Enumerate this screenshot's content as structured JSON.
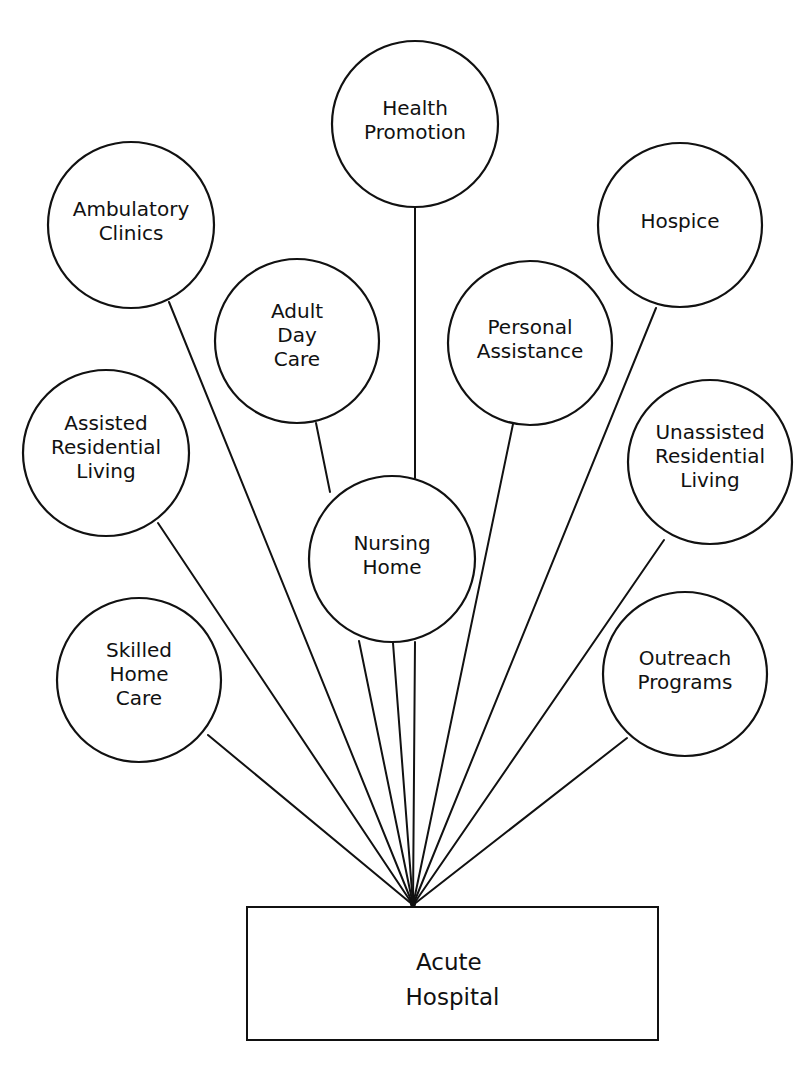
{
  "diagram": {
    "hub": {
      "label_lines": [
        "Acute",
        "Hospital"
      ],
      "x": 247,
      "y": 907,
      "w": 411,
      "h": 133,
      "anchor": [
        413,
        907
      ]
    },
    "nodes": [
      {
        "id": "health-promotion",
        "label_lines": [
          "Health",
          "Promotion"
        ],
        "cx": 415,
        "cy": 124,
        "r": 83,
        "edges": [
          [
            415,
            207,
            415,
            478
          ],
          [
            415,
            642,
            413,
            905
          ]
        ]
      },
      {
        "id": "ambulatory-clinics",
        "label_lines": [
          "Ambulatory",
          "Clinics"
        ],
        "cx": 131,
        "cy": 225,
        "r": 83,
        "edges": [
          [
            169,
            302,
            413,
            905
          ]
        ]
      },
      {
        "id": "hospice",
        "label_lines": [
          "Hospice"
        ],
        "cx": 680,
        "cy": 225,
        "r": 82,
        "edges": [
          [
            656,
            308,
            413,
            905
          ]
        ]
      },
      {
        "id": "adult-day-care",
        "label_lines": [
          "Adult",
          "Day",
          "Care"
        ],
        "cx": 297,
        "cy": 341,
        "r": 82,
        "edges": [
          [
            316,
            423,
            330,
            492
          ]
        ]
      },
      {
        "id": "personal-assistance",
        "label_lines": [
          "Personal",
          "Assistance"
        ],
        "cx": 530,
        "cy": 343,
        "r": 82,
        "edges": [
          [
            513,
            424,
            413,
            905
          ]
        ]
      },
      {
        "id": "assisted-residential-living",
        "label_lines": [
          "Assisted",
          "Residential",
          "Living"
        ],
        "cx": 106,
        "cy": 453,
        "r": 83,
        "edges": [
          [
            158,
            523,
            413,
            905
          ]
        ]
      },
      {
        "id": "nursing-home",
        "label_lines": [
          "Nursing",
          "Home"
        ],
        "cx": 392,
        "cy": 559,
        "r": 83,
        "edges": [
          [
            359,
            641,
            413,
            905
          ],
          [
            393,
            643,
            413,
            905
          ]
        ]
      },
      {
        "id": "unassisted-residential-living",
        "label_lines": [
          "Unassisted",
          "Residential",
          "Living"
        ],
        "cx": 710,
        "cy": 462,
        "r": 82,
        "edges": [
          [
            664,
            540,
            413,
            905
          ]
        ]
      },
      {
        "id": "skilled-home-care",
        "label_lines": [
          "Skilled",
          "Home",
          "Care"
        ],
        "cx": 139,
        "cy": 680,
        "r": 82,
        "edges": [
          [
            208,
            735,
            413,
            905
          ]
        ]
      },
      {
        "id": "outreach-programs",
        "label_lines": [
          "Outreach",
          "Programs"
        ],
        "cx": 685,
        "cy": 674,
        "r": 82,
        "edges": [
          [
            627,
            738,
            413,
            905
          ]
        ]
      }
    ]
  }
}
